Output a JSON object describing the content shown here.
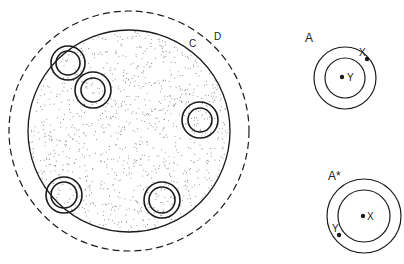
{
  "diagram": {
    "colors": {
      "stroke": "#1a1a1a",
      "stipple": "#8a8a8a",
      "background": "#ffffff"
    },
    "main": {
      "outer_dashed_circle": {
        "label": "D",
        "cx": 129,
        "cy": 131,
        "r": 120
      },
      "inner_solid_circle": {
        "label": "C",
        "cx": 129,
        "cy": 131,
        "r": 101,
        "fill": "stippled"
      },
      "small_double_circles": [
        {
          "cx": 68,
          "cy": 63,
          "r_outer": 17,
          "r_inner": 12
        },
        {
          "cx": 93,
          "cy": 90,
          "r_outer": 18,
          "r_inner": 12
        },
        {
          "cx": 200,
          "cy": 120,
          "r_outer": 18,
          "r_inner": 12
        },
        {
          "cx": 64,
          "cy": 195,
          "r_outer": 18,
          "r_inner": 13
        },
        {
          "cx": 162,
          "cy": 200,
          "r_outer": 18,
          "r_inner": 13
        }
      ]
    },
    "panel_a": {
      "label": "A",
      "cx": 345,
      "cy": 78,
      "r_outer": 31,
      "r_inner": 20,
      "points": [
        {
          "label": "Y",
          "x": 342,
          "y": 77
        },
        {
          "label": "X",
          "x": 367,
          "y": 59
        }
      ]
    },
    "panel_a_star": {
      "label": "A*",
      "cx": 364,
      "cy": 216,
      "r_outer": 37,
      "r_inner": 26,
      "points": [
        {
          "label": "X",
          "x": 363,
          "y": 216
        },
        {
          "label": "Y",
          "x": 339,
          "y": 235
        }
      ]
    }
  }
}
